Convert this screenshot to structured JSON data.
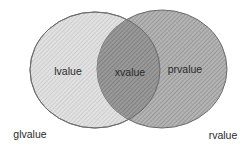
{
  "diagram": {
    "type": "venn",
    "sets": {
      "left": {
        "name": "glvalue",
        "label_position": "bottom-left-outside"
      },
      "right": {
        "name": "rvalue",
        "label_position": "bottom-right-outside"
      }
    },
    "regions": {
      "left_only": "lvalue",
      "intersection": "xvalue",
      "right_only": "prvalue"
    },
    "outer_labels": {
      "left": "glvalue",
      "right": "rvalue"
    },
    "colors": {
      "left_fill": "#d9d9d9",
      "right_fill": "#a9a9a9",
      "intersection_fill": "#8c8c8c",
      "stroke": "#6e6e6e",
      "hatch_light": "#bdbdbd",
      "hatch_dark": "#7a7a7a",
      "text": "#2a2a2a",
      "background": "#ffffff"
    }
  }
}
